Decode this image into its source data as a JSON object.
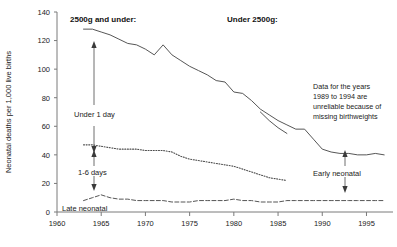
{
  "chart_data": {
    "type": "line",
    "title": "",
    "xlabel": "",
    "ylabel": "Neonatal deaths per 1,000 live births",
    "xlim": [
      1960,
      1998
    ],
    "ylim": [
      0,
      140
    ],
    "xticks": [
      1960,
      1965,
      1970,
      1975,
      1980,
      1985,
      1990,
      1995
    ],
    "yticks": [
      0,
      20,
      40,
      60,
      80,
      100,
      120,
      140
    ],
    "grid": false,
    "legend": "inline-annotations",
    "headings": {
      "left": "2500g and under:",
      "right": "Under 2500g:"
    },
    "annotation": {
      "lines": [
        "Data for the years",
        "1989 to 1994 are",
        "unreliable because of",
        "missing birthweights"
      ]
    },
    "series": [
      {
        "name": "Under 1 day",
        "label": "Under 1 day",
        "style": "solid",
        "x": [
          1963,
          1964,
          1965,
          1966,
          1967,
          1968,
          1969,
          1970,
          1971,
          1972,
          1973,
          1974,
          1975,
          1976,
          1977,
          1978,
          1979,
          1980,
          1981,
          1982,
          1983,
          1984,
          1985,
          1986,
          1987,
          1988,
          1989,
          1990,
          1991,
          1992,
          1993,
          1994,
          1995,
          1996,
          1997
        ],
        "values": [
          128,
          128,
          126,
          124,
          121,
          118,
          117,
          114,
          110,
          117,
          110,
          106,
          102,
          99,
          96,
          92,
          91,
          84,
          83,
          78,
          72,
          68,
          64,
          61,
          58,
          58,
          51,
          44,
          42,
          41,
          41,
          40,
          40,
          41,
          40
        ]
      },
      {
        "name": "Under 1 day (alternate birthweight basis)",
        "label": "",
        "style": "solid",
        "x": [
          1983,
          1984,
          1985,
          1986
        ],
        "values": [
          70,
          64,
          59,
          55
        ]
      },
      {
        "name": "1-6 days",
        "label": "1-6 days",
        "style": "dotted",
        "x": [
          1963,
          1964,
          1965,
          1966,
          1967,
          1968,
          1969,
          1970,
          1971,
          1972,
          1973,
          1974,
          1975,
          1976,
          1977,
          1978,
          1979,
          1980,
          1981,
          1982,
          1983,
          1984,
          1985,
          1986
        ],
        "values": [
          47,
          47,
          46,
          45,
          44,
          44,
          44,
          43,
          43,
          43,
          42,
          39,
          37,
          36,
          35,
          34,
          33,
          32,
          30,
          28,
          26,
          24,
          23,
          22
        ]
      },
      {
        "name": "Late neonatal",
        "label": "Late neonatal",
        "style": "dashed",
        "x": [
          1963,
          1964,
          1965,
          1966,
          1967,
          1968,
          1969,
          1970,
          1971,
          1972,
          1973,
          1974,
          1975,
          1976,
          1977,
          1978,
          1979,
          1980,
          1981,
          1982,
          1983,
          1984,
          1985,
          1986,
          1987,
          1988,
          1989,
          1990,
          1991,
          1992,
          1993,
          1994,
          1995,
          1996,
          1997
        ],
        "values": [
          8,
          10,
          12,
          10,
          9,
          9,
          8,
          8,
          8,
          8,
          7,
          7,
          7,
          8,
          8,
          8,
          8,
          9,
          8,
          8,
          7,
          7,
          7,
          8,
          8,
          8,
          8,
          8,
          8,
          8,
          8,
          8,
          8,
          8,
          8
        ]
      },
      {
        "name": "Early neonatal",
        "label": "Early neonatal",
        "style": "annotation-only",
        "x": [],
        "values": []
      }
    ]
  },
  "footer": {
    "text": ""
  }
}
